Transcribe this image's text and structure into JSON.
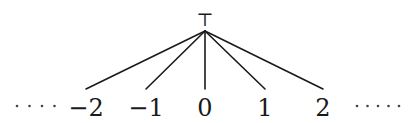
{
  "diagram": {
    "type": "hasse-diagram",
    "top": {
      "label": "⊤",
      "x": 205,
      "y": 31
    },
    "nodes": [
      {
        "id": "n-2",
        "label": "−2",
        "x": 86,
        "y": 89
      },
      {
        "id": "n-1",
        "label": "−1",
        "x": 146,
        "y": 89
      },
      {
        "id": "n0",
        "label": "0",
        "x": 205,
        "y": 89
      },
      {
        "id": "n1",
        "label": "1",
        "x": 265,
        "y": 89
      },
      {
        "id": "n2",
        "label": "2",
        "x": 323,
        "y": 89
      }
    ],
    "edges": [
      {
        "from": "top",
        "to": "n-2"
      },
      {
        "from": "top",
        "to": "n-1"
      },
      {
        "from": "top",
        "to": "n0"
      },
      {
        "from": "top",
        "to": "n1"
      },
      {
        "from": "top",
        "to": "n2"
      }
    ],
    "left_ellipsis": {
      "count": 4,
      "x_start": 17,
      "spacing": 12.5,
      "y": 106
    },
    "right_ellipsis": {
      "count": 5,
      "x_start": 357,
      "spacing": 10.5,
      "y": 106
    }
  },
  "colors": {
    "ink": "#1a1a1a",
    "background": "#ffffff"
  }
}
